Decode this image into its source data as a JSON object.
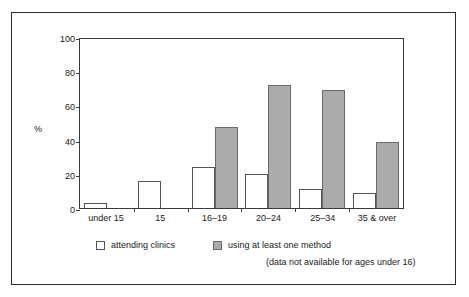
{
  "chart_data": {
    "type": "bar",
    "title": "",
    "xlabel": "",
    "ylabel": "%",
    "ylim": [
      0,
      100
    ],
    "yticks": [
      0,
      20,
      40,
      60,
      80,
      100
    ],
    "grid": false,
    "legend_position": "bottom",
    "categories": [
      "under 15",
      "15",
      "16–19",
      "20–24",
      "25–34",
      "35 & over"
    ],
    "series": [
      {
        "name": "attending clinics",
        "color": "#ffffff",
        "values": [
          3,
          16,
          24,
          20,
          11,
          9
        ]
      },
      {
        "name": "using at least one method",
        "color": "#ababab",
        "values": [
          null,
          null,
          48,
          73,
          70,
          39
        ]
      }
    ],
    "annotations": [
      "(data not available for ages under 16)"
    ]
  },
  "axis": {
    "y_label": "%",
    "y_ticks": [
      "100",
      "80",
      "60",
      "40",
      "20",
      "0"
    ],
    "x_ticks": [
      "under 15",
      "15",
      "16–19",
      "20–24",
      "25–34",
      "35 & over"
    ]
  },
  "legend": {
    "item_white": "attending clinics",
    "item_gray": "using at least one method",
    "note": "(data not available for ages under 16)"
  },
  "colors": {
    "gray_fill": "#ababab",
    "gray_border": "#6a6a6a",
    "white_fill": "#ffffff",
    "white_border": "#555555",
    "frame": "#3a3a3a",
    "outer_frame": "#2b2b2b"
  }
}
